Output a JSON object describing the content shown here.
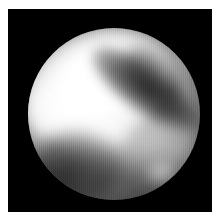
{
  "page": {
    "background_color": "#ffffff",
    "width": 218,
    "height": 222
  },
  "image_frame": {
    "name": "planetary-disk-photograph",
    "background_color": "#000000",
    "left": 8,
    "top": 9,
    "width": 204,
    "height": 203
  },
  "disk": {
    "label": "planetary disk",
    "center_x": 106,
    "center_y": 114,
    "diameter": 172,
    "peak_color": "#ffffff",
    "mid_color": "#9a9a9a",
    "shadow_color": "#000000"
  },
  "features": [
    {
      "name": "bright-albedo-region",
      "description": "large bright cloud/albedo region across upper-left to centre",
      "tone": "bright"
    },
    {
      "name": "bright-core",
      "description": "saturated white core of the bright region",
      "tone": "peak-white"
    },
    {
      "name": "bright-left-lobe",
      "description": "bright lobe extending to the left limb",
      "tone": "bright"
    },
    {
      "name": "bright-tail",
      "description": "bright tail reaching down toward lower-left centre",
      "tone": "bright"
    },
    {
      "name": "dark-diagonal-band",
      "description": "dark band running from upper-right down to lower-left centre",
      "tone": "dark"
    },
    {
      "name": "dark-lower-left-patch",
      "description": "dark patch in the lower-left quadrant near the limb",
      "tone": "dark"
    },
    {
      "name": "dark-bottom-mottling",
      "description": "diffuse dark mottling along the lower limb",
      "tone": "dark"
    },
    {
      "name": "mid-grey-right-limb",
      "description": "mid-grey mottled terrain on the right limb",
      "tone": "mid"
    },
    {
      "name": "mid-upper-right",
      "description": "mid-grey region at the upper-right limb",
      "tone": "mid"
    },
    {
      "name": "bright-speck-lower-right",
      "description": "small bright speck near the lower-right limb",
      "tone": "bright"
    }
  ],
  "texture": {
    "name": "vertical-scanlines",
    "description": "fine vertical scanline striping from the digitised source"
  }
}
